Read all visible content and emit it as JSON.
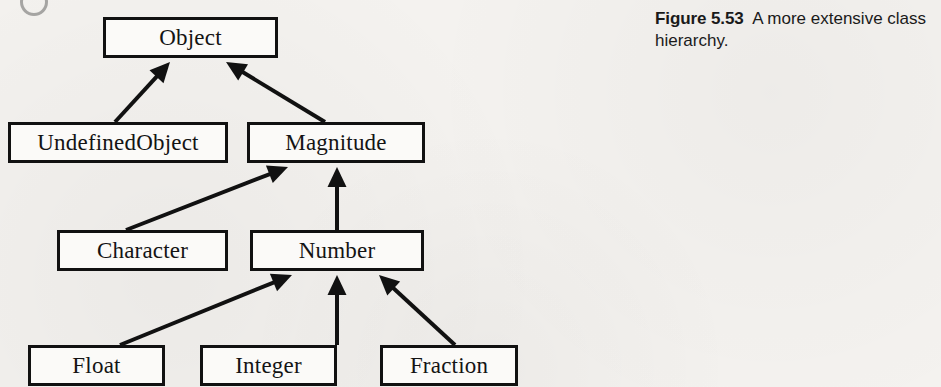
{
  "figure": {
    "caption_label": "Figure 5.53",
    "caption_text": "A more extensive class hierarchy.",
    "page_background": "#f4f2ef",
    "ink_color": "#111111",
    "box_fill": "#fbfaf8"
  },
  "diagram": {
    "type": "class-hierarchy",
    "arrow_style": "solid-filled-triangle-pointing-to-superclass",
    "nodes": [
      {
        "id": "object",
        "label": "Object",
        "x": 103,
        "y": 17,
        "w": 175,
        "h": 41
      },
      {
        "id": "undefined-object",
        "label": "UndefinedObject",
        "x": 8,
        "y": 122,
        "w": 220,
        "h": 41
      },
      {
        "id": "magnitude",
        "label": "Magnitude",
        "x": 247,
        "y": 122,
        "w": 178,
        "h": 41
      },
      {
        "id": "character",
        "label": "Character",
        "x": 57,
        "y": 230,
        "w": 171,
        "h": 41
      },
      {
        "id": "number",
        "label": "Number",
        "x": 250,
        "y": 230,
        "w": 174,
        "h": 41
      },
      {
        "id": "float",
        "label": "Float",
        "x": 28,
        "y": 345,
        "w": 137,
        "h": 41
      },
      {
        "id": "integer",
        "label": "Integer",
        "x": 200,
        "y": 345,
        "w": 137,
        "h": 41
      },
      {
        "id": "fraction",
        "label": "Fraction",
        "x": 380,
        "y": 345,
        "w": 138,
        "h": 41
      }
    ],
    "edges": [
      {
        "id": "undefined-object-to-object",
        "from": "undefined-object",
        "to": "object",
        "x1": 115,
        "y1": 122,
        "x2": 170,
        "y2": 62
      },
      {
        "id": "magnitude-to-object",
        "from": "magnitude",
        "to": "object",
        "x1": 325,
        "y1": 122,
        "x2": 226,
        "y2": 62
      },
      {
        "id": "character-to-magnitude",
        "from": "character",
        "to": "magnitude",
        "x1": 126,
        "y1": 230,
        "x2": 288,
        "y2": 167
      },
      {
        "id": "number-to-magnitude",
        "from": "number",
        "to": "magnitude",
        "x1": 337,
        "y1": 230,
        "x2": 337,
        "y2": 167
      },
      {
        "id": "float-to-number",
        "from": "float",
        "to": "number",
        "x1": 120,
        "y1": 345,
        "x2": 292,
        "y2": 275
      },
      {
        "id": "integer-to-number",
        "from": "integer",
        "to": "number",
        "x1": 337,
        "y1": 345,
        "x2": 337,
        "y2": 275
      },
      {
        "id": "fraction-to-number",
        "from": "fraction",
        "to": "number",
        "x1": 455,
        "y1": 345,
        "x2": 379,
        "y2": 275
      }
    ]
  }
}
